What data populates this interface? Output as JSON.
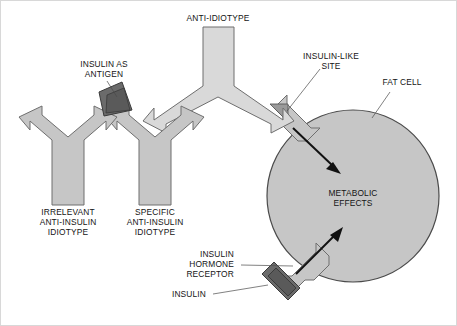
{
  "figure": {
    "background_color": "#ffffff",
    "frame_color": "#d8d8d8",
    "palette": {
      "antibody_fill": "#c6c6c6",
      "antibody_fill_light": "#d9d9d9",
      "antibody_stroke": "#6e6e6e",
      "insulin_dark": "#6b6b6b",
      "site_mid": "#9a9a9a",
      "cell_fill": "#c6c6c6",
      "cell_stroke": "#4a4a4a",
      "arrow_color": "#111111",
      "text_color": "#141414",
      "leader_color": "#4a4a4a"
    }
  },
  "labels": {
    "anti_idiotype": {
      "lines": [
        "ANTI-IDIOTYPE"
      ],
      "name": "anti-idiotype-label"
    },
    "insulin_as_antigen": {
      "lines": [
        "INSULIN AS",
        "ANTIGEN"
      ],
      "name": "insulin-as-antigen-label"
    },
    "insulin_like_site": {
      "lines": [
        "INSULIN-LIKE",
        "SITE"
      ],
      "name": "insulin-like-site-label"
    },
    "fat_cell": {
      "lines": [
        "FAT CELL"
      ],
      "name": "fat-cell-label"
    },
    "irrelevant_idiotype": {
      "lines": [
        "IRRELEVANT",
        "ANTI-INSULIN",
        "IDIOTYPE"
      ],
      "name": "irrelevant-anti-insulin-idiotype-label"
    },
    "specific_idiotype": {
      "lines": [
        "SPECIFIC",
        "ANTI-INSULIN",
        "IDIOTYPE"
      ],
      "name": "specific-anti-insulin-idiotype-label"
    },
    "metabolic_effects": {
      "lines": [
        "METABOLIC",
        "EFFECTS"
      ],
      "name": "metabolic-effects-label"
    },
    "insulin_hormone_receptor": {
      "lines": [
        "INSULIN",
        "HORMONE",
        "RECEPTOR"
      ],
      "name": "insulin-hormone-receptor-label"
    },
    "insulin": {
      "lines": [
        "INSULIN"
      ],
      "name": "insulin-label"
    }
  },
  "shapes": {
    "irrelevant_antibody": {
      "name": "irrelevant-antibody-shape",
      "kind": "y-antibody"
    },
    "specific_antibody": {
      "name": "specific-antibody-shape",
      "kind": "y-antibody"
    },
    "anti_idiotype_antibody": {
      "name": "anti-idiotype-antibody-shape",
      "kind": "inverted-y-antibody"
    },
    "insulin_antigen_wedge": {
      "name": "insulin-antigen-wedge-shape",
      "kind": "dark-wedge"
    },
    "insulin_molecule": {
      "name": "insulin-molecule-shape",
      "kind": "dark-wedge"
    },
    "insulin_like_site_wedge": {
      "name": "insulin-like-site-wedge-shape",
      "kind": "mid-wedge"
    },
    "fat_cell": {
      "name": "fat-cell-shape",
      "kind": "circle"
    },
    "upper_receptor": {
      "name": "upper-hormone-receptor-shape",
      "kind": "receptor-arrow"
    },
    "lower_receptor": {
      "name": "lower-hormone-receptor-shape",
      "kind": "receptor-arrow"
    },
    "upper_signal_arrow": {
      "name": "upper-signal-arrow",
      "kind": "arrow"
    },
    "lower_signal_arrow": {
      "name": "lower-signal-arrow",
      "kind": "arrow"
    }
  }
}
